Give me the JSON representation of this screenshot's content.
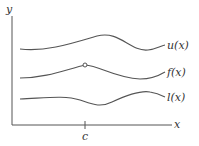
{
  "axes": {
    "x_label": "x",
    "y_label": "y",
    "tick_label": "c"
  },
  "curves": [
    {
      "name": "upper",
      "label": "u(x)"
    },
    {
      "name": "middle",
      "label": "f(x)",
      "hole_at": "c"
    },
    {
      "name": "lower",
      "label": "l(x)"
    }
  ],
  "colors": {
    "line": "#555555",
    "text": "#333333"
  }
}
